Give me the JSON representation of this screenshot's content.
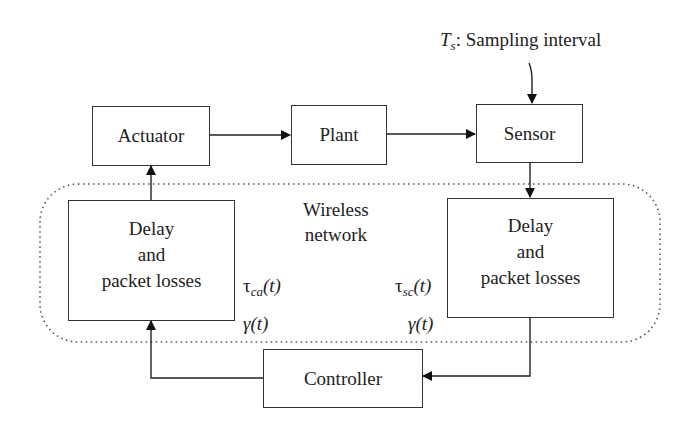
{
  "diagram": {
    "type": "block-diagram",
    "blocks": {
      "actuator": "Actuator",
      "plant": "Plant",
      "sensor": "Sensor",
      "controller": "Controller",
      "delay_ca": {
        "line1": "Delay",
        "line2": "and",
        "line3": "packet losses"
      },
      "delay_sc": {
        "line1": "Delay",
        "line2": "and",
        "line3": "packet losses"
      }
    },
    "region": {
      "line1": "Wireless",
      "line2": "network"
    },
    "sampling": {
      "symbol": "T",
      "subscript": "s",
      "text": ": Sampling interval"
    },
    "signals": {
      "tau_ca": {
        "symbol": "τ",
        "subscript": "ca",
        "arg": "(t)"
      },
      "gamma_left": {
        "symbol": "γ",
        "arg": "(t)"
      },
      "tau_sc": {
        "symbol": "τ",
        "subscript": "sc",
        "arg": "(t)"
      },
      "gamma_right": {
        "symbol": "γ",
        "arg": "(t)"
      }
    },
    "edges": [
      [
        "Actuator",
        "Plant"
      ],
      [
        "Plant",
        "Sensor"
      ],
      [
        "Ts",
        "Sensor"
      ],
      [
        "Sensor",
        "Delay and packet losses (sc)"
      ],
      [
        "Delay and packet losses (sc)",
        "Controller"
      ],
      [
        "Controller",
        "Delay and packet losses (ca)"
      ],
      [
        "Delay and packet losses (ca)",
        "Actuator"
      ]
    ]
  }
}
